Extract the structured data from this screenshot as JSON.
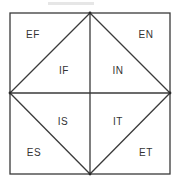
{
  "diagram": {
    "type": "square-with-inscribed-diamond",
    "line_color": "#3a3a3a",
    "text_color": "#333333",
    "regions": {
      "outer_top_left": "EF",
      "outer_top_right": "EN",
      "inner_top_left": "IF",
      "inner_top_right": "IN",
      "inner_bottom_left": "IS",
      "inner_bottom_right": "IT",
      "outer_bottom_left": "ES",
      "outer_bottom_right": "ET"
    }
  }
}
